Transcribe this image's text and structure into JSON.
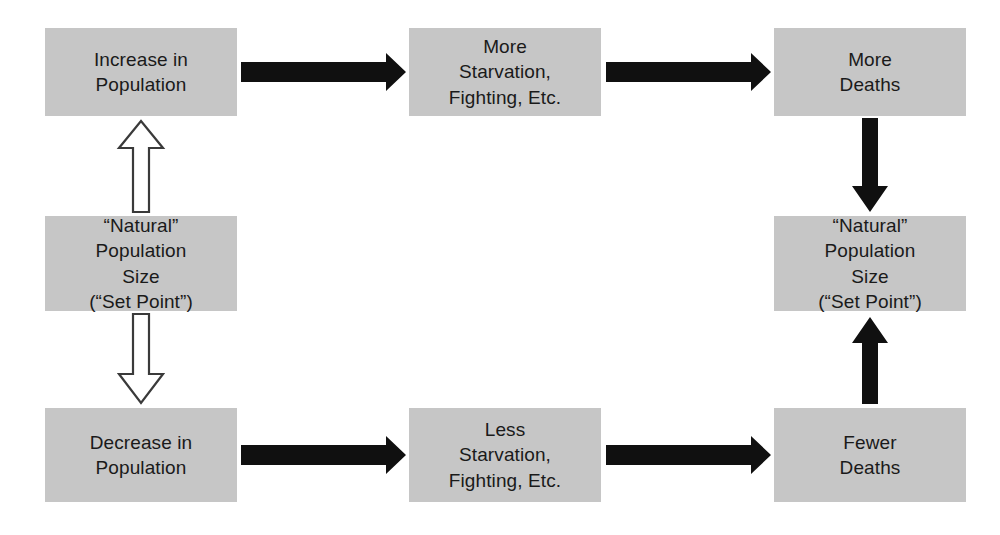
{
  "diagram": {
    "background_color": "#ffffff",
    "box_fill_color": "#c6c6c6",
    "box_text_color": "#1a1a1a",
    "solid_arrow_color": "#101010",
    "hollow_arrow_fill": "#ffffff",
    "hollow_arrow_stroke": "#3a3a3a"
  },
  "nodes": {
    "increase_population": {
      "id": "increase-in-population",
      "lines": [
        "Increase in",
        "Population"
      ]
    },
    "more_starvation": {
      "id": "more-starvation-fighting-etc",
      "lines": [
        "More",
        "Starvation,",
        "Fighting, Etc."
      ]
    },
    "more_deaths": {
      "id": "more-deaths",
      "lines": [
        "More",
        "Deaths"
      ]
    },
    "set_point_left": {
      "id": "natural-population-size-set-point-left",
      "lines": [
        "“Natural”",
        "Population",
        "Size",
        "(“Set Point”)"
      ]
    },
    "set_point_right": {
      "id": "natural-population-size-set-point-right",
      "lines": [
        "“Natural”",
        "Population",
        "Size",
        "(“Set Point”)"
      ]
    },
    "decrease_population": {
      "id": "decrease-in-population",
      "lines": [
        "Decrease in",
        "Population"
      ]
    },
    "less_starvation": {
      "id": "less-starvation-fighting-etc",
      "lines": [
        "Less",
        "Starvation,",
        "Fighting, Etc."
      ]
    },
    "fewer_deaths": {
      "id": "fewer-deaths",
      "lines": [
        "Fewer",
        "Deaths"
      ]
    }
  },
  "arrows": [
    {
      "name": "arrow-increase-to-more-starvation",
      "style": "solid",
      "direction": "right",
      "from": "increase_population",
      "to": "more_starvation"
    },
    {
      "name": "arrow-more-starvation-to-more-deaths",
      "style": "solid",
      "direction": "right",
      "from": "more_starvation",
      "to": "more_deaths"
    },
    {
      "name": "arrow-more-deaths-to-set-point-right",
      "style": "solid",
      "direction": "down",
      "from": "more_deaths",
      "to": "set_point_right"
    },
    {
      "name": "arrow-fewer-deaths-to-set-point-right",
      "style": "solid",
      "direction": "up",
      "from": "fewer_deaths",
      "to": "set_point_right"
    },
    {
      "name": "arrow-decrease-to-less-starvation",
      "style": "solid",
      "direction": "right",
      "from": "decrease_population",
      "to": "less_starvation"
    },
    {
      "name": "arrow-less-starvation-to-fewer-deaths",
      "style": "solid",
      "direction": "right",
      "from": "less_starvation",
      "to": "fewer_deaths"
    },
    {
      "name": "arrow-set-point-left-to-increase",
      "style": "hollow",
      "direction": "up",
      "from": "set_point_left",
      "to": "increase_population"
    },
    {
      "name": "arrow-set-point-left-to-decrease",
      "style": "hollow",
      "direction": "down",
      "from": "set_point_left",
      "to": "decrease_population"
    }
  ]
}
